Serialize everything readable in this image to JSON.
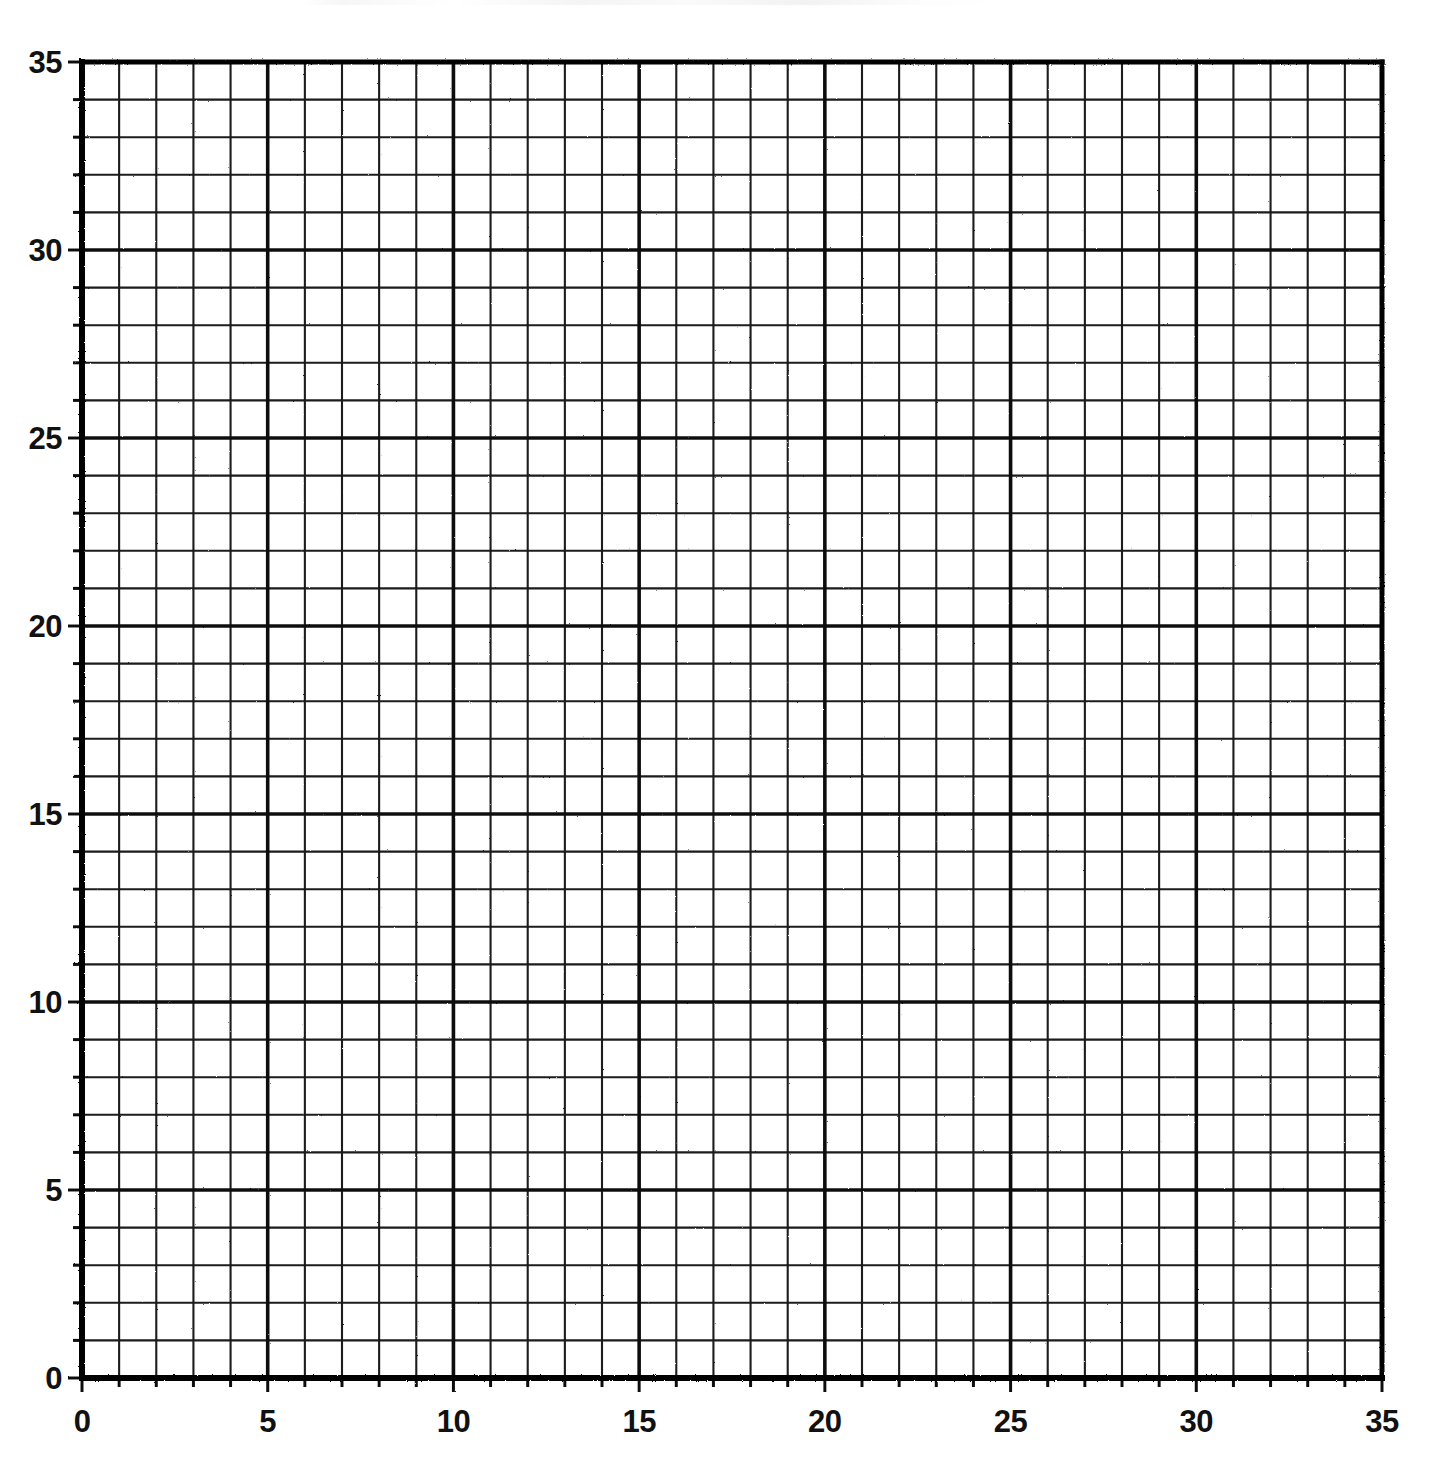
{
  "figure": {
    "kind": "graph-paper-grid",
    "background_color": "#ffffff",
    "ink_color": "#111111"
  },
  "chart_data": {
    "type": "scatter",
    "title": "",
    "subtitle": "",
    "xlabel": "",
    "ylabel": "",
    "xlim": [
      0,
      35
    ],
    "ylim": [
      0,
      35
    ],
    "grid": true,
    "grid_minor_step": 1,
    "grid_major_step": 5,
    "legend": "none",
    "x_ticks": [
      0,
      5,
      10,
      15,
      20,
      25,
      30,
      35
    ],
    "y_ticks": [
      0,
      5,
      10,
      15,
      20,
      25,
      30,
      35
    ],
    "x_tick_labels": [
      "0",
      "5",
      "10",
      "15",
      "20",
      "25",
      "30",
      "35"
    ],
    "y_tick_labels": [
      "0",
      "5",
      "10",
      "15",
      "20",
      "25",
      "30",
      "35"
    ],
    "x_minor_ticks": [
      0,
      1,
      2,
      3,
      4,
      5,
      6,
      7,
      8,
      9,
      10,
      11,
      12,
      13,
      14,
      15,
      16,
      17,
      18,
      19,
      20,
      21,
      22,
      23,
      24,
      25,
      26,
      27,
      28,
      29,
      30,
      31,
      32,
      33,
      34,
      35
    ],
    "y_minor_ticks": [
      0,
      1,
      2,
      3,
      4,
      5,
      6,
      7,
      8,
      9,
      10,
      11,
      12,
      13,
      14,
      15,
      16,
      17,
      18,
      19,
      20,
      21,
      22,
      23,
      24,
      25,
      26,
      27,
      28,
      29,
      30,
      31,
      32,
      33,
      34,
      35
    ],
    "series": [],
    "values": [],
    "categories": [],
    "annotations": []
  },
  "axes": {
    "y_axis": {
      "name": "y-axis",
      "labels": [
        "35",
        "30",
        "25",
        "20",
        "15",
        "10",
        "5",
        "0"
      ],
      "values": [
        35,
        30,
        25,
        20,
        15,
        10,
        5,
        0
      ]
    },
    "x_axis": {
      "name": "x-axis",
      "labels": [
        "0",
        "5",
        "10",
        "15",
        "20",
        "25",
        "30",
        "35"
      ],
      "values": [
        0,
        5,
        10,
        15,
        20,
        25,
        30,
        35
      ]
    }
  }
}
